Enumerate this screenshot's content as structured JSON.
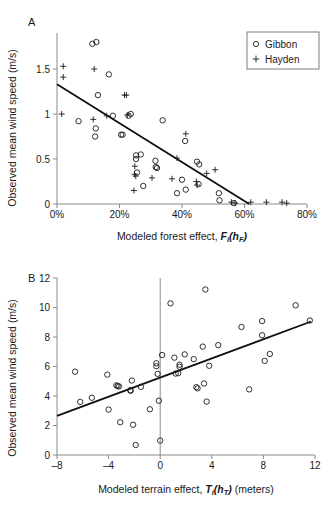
{
  "figure": {
    "panel_a_letter": "A",
    "panel_b_letter": "B"
  },
  "legend": {
    "position": "top-right",
    "items": [
      {
        "label": "Gibbon",
        "marker": "circle-marker-icon"
      },
      {
        "label": "Hayden",
        "marker": "plus-marker-icon"
      }
    ]
  },
  "chart_data": [
    {
      "id": "panel-a",
      "type": "scatter",
      "title": "A",
      "xlabel": "Modeled forest effect, F_i(h_F)",
      "xlabel_parts": {
        "prefix": "Modeled forest effect, ",
        "var_main": "F",
        "var_sub": "i",
        "open": "(",
        "arg_main": "h",
        "arg_sub": "F",
        "close": ")",
        "suffix": ""
      },
      "ylabel": "Observed mean wind speed (m/s)",
      "xlim": [
        0,
        80
      ],
      "ylim": [
        0,
        1.9
      ],
      "xticks": [
        0,
        20,
        40,
        60,
        80
      ],
      "xtick_labels": [
        "0%",
        "20%",
        "40%",
        "60%",
        "80%"
      ],
      "yticks": [
        0,
        0.5,
        1,
        1.5
      ],
      "ytick_labels": [
        "0",
        "0.5",
        "1",
        "1.5"
      ],
      "grid": false,
      "trendline": {
        "x1": 0,
        "y1": 1.33,
        "x2": 61.5,
        "y2": 0.0
      },
      "series": [
        {
          "name": "Gibbon",
          "marker": "circle",
          "points": [
            [
              11.3,
              1.78
            ],
            [
              12.6,
              1.8
            ],
            [
              16.6,
              1.44
            ],
            [
              13.1,
              1.21
            ],
            [
              6.9,
              0.92
            ],
            [
              12.4,
              0.84
            ],
            [
              12.2,
              0.75
            ],
            [
              17.9,
              0.98
            ],
            [
              20.5,
              0.77
            ],
            [
              21.0,
              0.77
            ],
            [
              22.9,
              0.98
            ],
            [
              23.6,
              1.0
            ],
            [
              25.3,
              0.54
            ],
            [
              25.3,
              0.5
            ],
            [
              26.8,
              0.55
            ],
            [
              25.6,
              0.35
            ],
            [
              27.6,
              0.2
            ],
            [
              31.5,
              0.48
            ],
            [
              31.6,
              0.41
            ],
            [
              32.0,
              0.4
            ],
            [
              33.8,
              0.93
            ],
            [
              38.4,
              0.12
            ],
            [
              40.0,
              0.27
            ],
            [
              41.2,
              0.16
            ],
            [
              41.0,
              0.7
            ],
            [
              44.8,
              0.47
            ],
            [
              45.5,
              0.44
            ],
            [
              45.3,
              0.22
            ],
            [
              51.8,
              0.12
            ],
            [
              52.0,
              0.04
            ],
            [
              56.6,
              0.01
            ]
          ]
        },
        {
          "name": "Hayden",
          "marker": "plus",
          "points": [
            [
              2.0,
              1.53
            ],
            [
              2.0,
              1.41
            ],
            [
              1.5,
              1.0
            ],
            [
              11.9,
              1.5
            ],
            [
              11.6,
              0.94
            ],
            [
              15.9,
              0.98
            ],
            [
              21.6,
              1.21
            ],
            [
              22.2,
              1.21
            ],
            [
              22.5,
              0.99
            ],
            [
              24.9,
              0.42
            ],
            [
              24.8,
              0.33
            ],
            [
              24.6,
              0.15
            ],
            [
              25.2,
              0.31
            ],
            [
              30.4,
              0.29
            ],
            [
              36.8,
              0.28
            ],
            [
              38.4,
              0.51
            ],
            [
              41.2,
              0.78
            ],
            [
              44.6,
              0.25
            ],
            [
              44.8,
              0.21
            ],
            [
              47.9,
              0.34
            ],
            [
              50.6,
              0.38
            ],
            [
              55.8,
              0.02
            ],
            [
              57.0,
              0.01
            ],
            [
              62.0,
              0.02
            ],
            [
              67.0,
              0.02
            ],
            [
              72.0,
              0.02
            ],
            [
              73.5,
              0.01
            ]
          ]
        }
      ]
    },
    {
      "id": "panel-b",
      "type": "scatter",
      "title": "B",
      "xlabel": "Modeled terrain effect, T_i(h_T) (meters)",
      "xlabel_parts": {
        "prefix": "Modeled terrain effect, ",
        "var_main": "T",
        "var_sub": "i",
        "open": "(",
        "arg_main": "h",
        "arg_sub": "T",
        "close": ")",
        "suffix": " (meters)"
      },
      "ylabel": "Observed mean wind speed (m/s)",
      "xlim": [
        -8,
        12
      ],
      "ylim": [
        0,
        12
      ],
      "xticks": [
        -8,
        -4,
        0,
        4,
        8,
        12
      ],
      "xtick_labels": [
        "–8",
        "–4",
        "0",
        "4",
        "8",
        "12"
      ],
      "yticks": [
        0,
        2,
        4,
        6,
        8,
        10,
        12
      ],
      "ytick_labels": [
        "0",
        "2",
        "4",
        "6",
        "8",
        "10",
        "12"
      ],
      "grid": false,
      "zero_line": 0,
      "trendline": {
        "x1": -8,
        "y1": 2.65,
        "x2": 11.7,
        "y2": 9.05
      },
      "series": [
        {
          "name": "Gibbon",
          "marker": "circle",
          "points": [
            [
              -6.6,
              5.65
            ],
            [
              -6.2,
              3.6
            ],
            [
              -5.3,
              3.88
            ],
            [
              -4.1,
              5.45
            ],
            [
              -4.0,
              3.08
            ],
            [
              -3.4,
              4.72
            ],
            [
              -3.3,
              4.68
            ],
            [
              -3.2,
              4.65
            ],
            [
              -3.1,
              2.22
            ],
            [
              -2.3,
              4.4
            ],
            [
              -2.3,
              4.35
            ],
            [
              -2.2,
              5.05
            ],
            [
              -2.1,
              2.05
            ],
            [
              -1.9,
              0.68
            ],
            [
              -1.5,
              4.62
            ],
            [
              -0.8,
              3.1
            ],
            [
              -0.3,
              6.22
            ],
            [
              -0.3,
              6.02
            ],
            [
              -0.2,
              5.5
            ],
            [
              -0.1,
              3.68
            ],
            [
              0.0,
              0.98
            ],
            [
              0.15,
              6.78
            ],
            [
              0.8,
              10.28
            ],
            [
              1.1,
              6.6
            ],
            [
              1.2,
              5.52
            ],
            [
              1.4,
              5.55
            ],
            [
              1.5,
              6.12
            ],
            [
              1.5,
              5.98
            ],
            [
              1.9,
              6.82
            ],
            [
              2.6,
              6.5
            ],
            [
              2.8,
              4.6
            ],
            [
              2.9,
              4.52
            ],
            [
              3.3,
              7.35
            ],
            [
              3.4,
              4.85
            ],
            [
              3.5,
              11.22
            ],
            [
              3.6,
              3.62
            ],
            [
              3.8,
              6.05
            ],
            [
              4.5,
              7.45
            ],
            [
              6.3,
              8.68
            ],
            [
              6.9,
              4.45
            ],
            [
              7.9,
              9.08
            ],
            [
              7.9,
              8.12
            ],
            [
              8.1,
              6.38
            ],
            [
              8.5,
              6.85
            ],
            [
              10.5,
              10.15
            ],
            [
              11.6,
              9.12
            ]
          ]
        }
      ]
    }
  ]
}
